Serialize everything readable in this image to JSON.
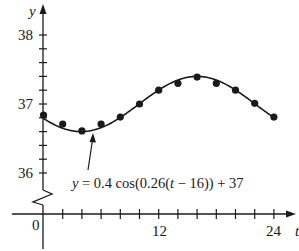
{
  "chart_data": {
    "type": "line",
    "title": "",
    "xlabel": "t",
    "ylabel": "y",
    "x_ticks": [
      0,
      12,
      24
    ],
    "x_minor_step": 2,
    "y_ticks": [
      36,
      37,
      38
    ],
    "y_minor_step": 0.2,
    "xlim": [
      0,
      24
    ],
    "ylim": [
      36,
      38
    ],
    "axis_break": "y-axis zigzag between 0 and 36",
    "grid": false,
    "annotation": "y = 0.4 cos(0.26(t − 16)) + 37",
    "series": [
      {
        "name": "data points",
        "kind": "scatter",
        "x": [
          0,
          2,
          4,
          6,
          8,
          10,
          12,
          14,
          16,
          18,
          20,
          22,
          24
        ],
        "y": [
          36.84,
          36.71,
          36.61,
          36.71,
          36.81,
          37.0,
          37.2,
          37.3,
          37.39,
          37.3,
          37.2,
          37.01,
          36.81
        ]
      },
      {
        "name": "model",
        "kind": "curve",
        "formula": "0.4*cos(0.26*(t-16))+37",
        "amplitude": 0.4,
        "frequency": 0.26,
        "phase_shift": 16,
        "vertical_shift": 37
      }
    ]
  },
  "labels": {
    "y_axis": "y",
    "x_axis": "t",
    "tick_38": "38",
    "tick_37": "37",
    "tick_36": "36",
    "tick_0": "0",
    "tick_12": "12",
    "tick_24": "24",
    "equation_prefix": "y",
    "equation_body": " = 0.4 cos(0.26(",
    "equation_var": "t",
    "equation_suffix": " − 16)) + 37"
  }
}
